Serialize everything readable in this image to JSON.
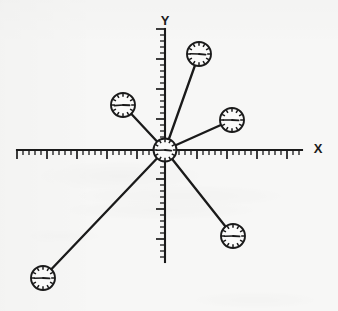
{
  "figure": {
    "background_color": "#f7f7f6",
    "ink_color": "#1a1a1a"
  },
  "axes": {
    "x_axis": {
      "label": "X",
      "label_x": 318,
      "label_y": 150,
      "line": {
        "x1": 17,
        "y1": 150,
        "x2": 302,
        "y2": 150
      },
      "tick_direction": "down",
      "tick_spacing": 6.0,
      "minor_tick_length": 5,
      "major_tick_length": 9,
      "major_every": 5,
      "tick_count": 48
    },
    "y_axis": {
      "label": "Y",
      "label_x": 165,
      "label_y": 22,
      "line": {
        "x1": 165,
        "y1": 29,
        "x2": 165,
        "y2": 262
      },
      "tick_direction": "left",
      "tick_spacing": 6.0,
      "minor_tick_length": 5,
      "major_tick_length": 9,
      "major_every": 5,
      "tick_count": 39
    },
    "origin": {
      "x": 165,
      "y": 150
    }
  },
  "clocks": [
    {
      "id": "clock-origin",
      "name": "origin-clock",
      "cx": 165,
      "cy": 150,
      "r": 11.5,
      "hour_angle_deg": 95,
      "minute_angle_deg": 268,
      "connected_to_origin": false
    },
    {
      "id": "clock-upper-right",
      "name": "upper-right-clock",
      "cx": 199,
      "cy": 54,
      "r": 12,
      "hour_angle_deg": 96,
      "minute_angle_deg": 272,
      "connected_to_origin": true
    },
    {
      "id": "clock-upper-left",
      "name": "upper-left-clock",
      "cx": 123,
      "cy": 105,
      "r": 12,
      "hour_angle_deg": 92,
      "minute_angle_deg": 266,
      "connected_to_origin": true
    },
    {
      "id": "clock-right",
      "name": "right-clock",
      "cx": 232,
      "cy": 120,
      "r": 12,
      "hour_angle_deg": 94,
      "minute_angle_deg": 270,
      "connected_to_origin": true
    },
    {
      "id": "clock-lower-right",
      "name": "lower-right-clock",
      "cx": 233,
      "cy": 236,
      "r": 12,
      "hour_angle_deg": 94,
      "minute_angle_deg": 268,
      "connected_to_origin": true
    },
    {
      "id": "clock-lower-left",
      "name": "lower-left-clock",
      "cx": 43,
      "cy": 278,
      "r": 12,
      "hour_angle_deg": 93,
      "minute_angle_deg": 268,
      "connected_to_origin": true
    }
  ],
  "connectors": [
    {
      "name": "connector-upper-right",
      "x1": 165,
      "y1": 150,
      "x2": 199,
      "y2": 54
    },
    {
      "name": "connector-upper-left",
      "x1": 165,
      "y1": 150,
      "x2": 123,
      "y2": 105
    },
    {
      "name": "connector-right",
      "x1": 165,
      "y1": 150,
      "x2": 232,
      "y2": 120
    },
    {
      "name": "connector-lower-right",
      "x1": 165,
      "y1": 150,
      "x2": 233,
      "y2": 236
    },
    {
      "name": "connector-lower-left",
      "x1": 165,
      "y1": 150,
      "x2": 43,
      "y2": 278
    }
  ],
  "clock_face": {
    "rim_tick_count": 12,
    "rim_tick_inner_ratio": 0.68,
    "face_fill": "#fbfbfa",
    "rim_color": "#1a1a1a"
  }
}
